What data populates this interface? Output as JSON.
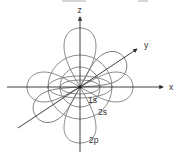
{
  "diagram": {
    "axes": [
      {
        "id": "x",
        "label": "x"
      },
      {
        "id": "y",
        "label": "y"
      },
      {
        "id": "z",
        "label": "z"
      }
    ],
    "orbitals": [
      {
        "id": "1s",
        "label": "1s",
        "shape": "sphere"
      },
      {
        "id": "2s",
        "label": "2s",
        "shape": "sphere"
      },
      {
        "id": "2p",
        "label": "2p",
        "shape": "dumbbell lobes along x, y, z"
      }
    ],
    "colors": {
      "axis": "#2a2a2a",
      "orbital": "#6e6e6e",
      "label": "#333333",
      "background": "#ffffff"
    }
  }
}
